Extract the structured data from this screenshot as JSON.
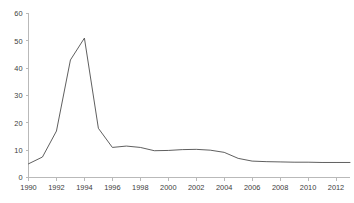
{
  "chart_data": {
    "type": "line",
    "title": "",
    "subtitle": "",
    "xlabel": "",
    "ylabel": "",
    "xlim": [
      1990,
      2013
    ],
    "ylim": [
      0,
      60
    ],
    "grid": false,
    "legend": false,
    "legend_position": "none",
    "line_color": "#4d4d4d",
    "axis_color": "#b9b9b9",
    "y_ticks": [
      0,
      10,
      20,
      30,
      40,
      50,
      60
    ],
    "x_ticks": [
      1990,
      1992,
      1994,
      1996,
      1998,
      2000,
      2002,
      2004,
      2006,
      2008,
      2010,
      2012
    ],
    "y_tick_labels": [
      "0",
      "10",
      "20",
      "30",
      "40",
      "50",
      "60"
    ],
    "x_tick_labels": [
      "1990",
      "1992",
      "1994",
      "1996",
      "1998",
      "2000",
      "2002",
      "2004",
      "2006",
      "2008",
      "2010",
      "2012"
    ],
    "x": [
      1990,
      1991,
      1992,
      1993,
      1994,
      1995,
      1996,
      1997,
      1998,
      1999,
      2000,
      2001,
      2002,
      2003,
      2004,
      2005,
      2006,
      2007,
      2008,
      2009,
      2010,
      2011,
      2012,
      2013
    ],
    "values": [
      5,
      7.5,
      17,
      43,
      51,
      18,
      11,
      11.5,
      11,
      9.8,
      9.9,
      10.2,
      10.3,
      10,
      9.2,
      7,
      6,
      5.8,
      5.7,
      5.6,
      5.6,
      5.5,
      5.5,
      5.5
    ],
    "series": [
      {
        "name": "series-1",
        "values": [
          5,
          7.5,
          17,
          43,
          51,
          18,
          11,
          11.5,
          11,
          9.8,
          9.9,
          10.2,
          10.3,
          10,
          9.2,
          7,
          6,
          5.8,
          5.7,
          5.6,
          5.6,
          5.5,
          5.5,
          5.5
        ]
      }
    ],
    "peak": {
      "x": 1994,
      "y": 51
    }
  }
}
